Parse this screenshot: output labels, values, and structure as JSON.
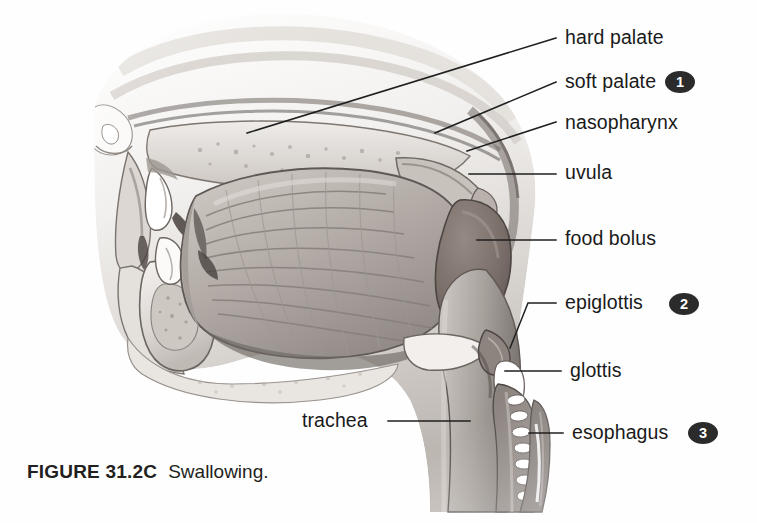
{
  "figure": {
    "caption_id": "FIGURE 31.2C",
    "caption_text": "Swallowing.",
    "style": "grayscale-medical-illustration",
    "colors": {
      "background": "#fefefe",
      "ink": "#1a1a1a",
      "badge_fill": "#2b2b2b",
      "badge_text": "#ffffff",
      "tissue_light": "#e8e5e2",
      "tissue_mid": "#b0aaa6",
      "tissue_dark": "#6e6864",
      "bolus": "#7a706c",
      "cartilage_white": "#f6f4f2"
    }
  },
  "labels": [
    {
      "id": "hard-palate",
      "text": "hard palate",
      "x": 565,
      "y": 28,
      "badge": null
    },
    {
      "id": "soft-palate",
      "text": "soft palate",
      "x": 565,
      "y": 72,
      "badge": "1"
    },
    {
      "id": "nasopharynx",
      "text": "nasopharynx",
      "x": 565,
      "y": 113,
      "badge": null
    },
    {
      "id": "uvula",
      "text": "uvula",
      "x": 565,
      "y": 163,
      "badge": null
    },
    {
      "id": "food-bolus",
      "text": "food bolus",
      "x": 565,
      "y": 229,
      "badge": null
    },
    {
      "id": "epiglottis",
      "text": "epiglottis",
      "x": 565,
      "y": 293,
      "badge": "2"
    },
    {
      "id": "glottis",
      "text": "glottis",
      "x": 570,
      "y": 361,
      "badge": null
    },
    {
      "id": "trachea",
      "text": "trachea",
      "x": 302,
      "y": 411,
      "badge": null
    },
    {
      "id": "esophagus",
      "text": "esophagus",
      "x": 572,
      "y": 423,
      "badge": "3"
    }
  ],
  "badges": [
    {
      "number": "1",
      "x": 665,
      "y": 71,
      "label": "soft-palate"
    },
    {
      "number": "2",
      "x": 669,
      "y": 293,
      "label": "epiglottis"
    },
    {
      "number": "3",
      "x": 688,
      "y": 422,
      "label": "esophagus"
    }
  ],
  "anatomy_parts": [
    "nose",
    "lips",
    "upper teeth",
    "lower teeth",
    "mandible",
    "hard palate",
    "soft palate",
    "nasopharynx",
    "uvula",
    "tongue",
    "food bolus",
    "epiglottis",
    "glottis",
    "larynx",
    "trachea",
    "esophagus"
  ]
}
